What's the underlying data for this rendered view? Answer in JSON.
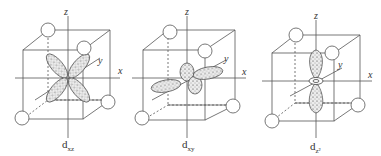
{
  "figure": {
    "panels": [
      {
        "id": "dxz",
        "label_main": "d",
        "label_sub": "xz",
        "axes": {
          "x": "x",
          "y": "y",
          "z": "z"
        }
      },
      {
        "id": "dxy",
        "label_main": "d",
        "label_sub": "xy",
        "axes": {
          "x": "x",
          "y": "y",
          "z": "z"
        }
      },
      {
        "id": "dz2",
        "label_main": "d",
        "label_sub": "z²",
        "axes": {
          "x": "x",
          "y": "y",
          "z": "z"
        }
      }
    ],
    "colors": {
      "line": "#555555",
      "lobe_fill": "#e6e6e6",
      "dots": "#333333",
      "background": "#ffffff"
    }
  }
}
